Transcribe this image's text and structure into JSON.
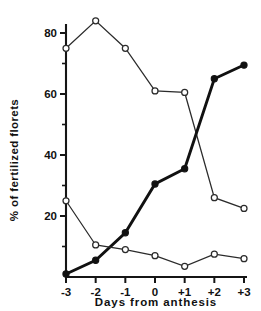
{
  "chart_data": {
    "type": "line",
    "title": "",
    "xlabel": "Days from anthesis",
    "ylabel": "% of fertilized florets",
    "x": [
      -3,
      -2,
      -1,
      0,
      1,
      2,
      3
    ],
    "categories": [
      "-3",
      "-2",
      "-1",
      "0",
      "+1",
      "+2",
      "+3"
    ],
    "xlim": [
      -3,
      3
    ],
    "ylim": [
      0,
      88
    ],
    "yticks": [
      20,
      40,
      60,
      80
    ],
    "ytick_labels": [
      "20",
      "40",
      "60",
      "80"
    ],
    "yminor_ticks": [
      10,
      30,
      50,
      70
    ],
    "grid": false,
    "legend": "none",
    "series": [
      {
        "name": "upper-open-circles",
        "marker": "open-circle",
        "line_weight": "thin",
        "values": [
          75,
          84,
          75,
          61,
          60.5,
          26,
          22.5
        ]
      },
      {
        "name": "filled-circles",
        "marker": "filled-circle",
        "line_weight": "thick",
        "values": [
          1,
          5.5,
          14.5,
          30.5,
          35.5,
          65,
          69.5
        ]
      },
      {
        "name": "lower-open-circles",
        "marker": "open-circle",
        "line_weight": "thin",
        "values": [
          25,
          10.5,
          9,
          7,
          3.5,
          7.5,
          6
        ]
      }
    ]
  },
  "axes": {
    "y_axis_title": "% of fertilized florets",
    "x_axis_title": "Days from anthesis"
  },
  "colors": {
    "ink": "#111111",
    "line": "#2b2b2b",
    "background": "#ffffff"
  }
}
